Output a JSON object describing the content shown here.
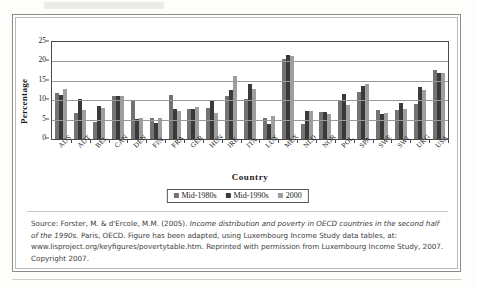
{
  "chart_data": {
    "type": "bar",
    "title": "",
    "xlabel": "Country",
    "ylabel": "Percentage",
    "ylim": [
      0,
      25
    ],
    "yticks": [
      0,
      5,
      10,
      15,
      20,
      25
    ],
    "grid": true,
    "legend_position": "bottom",
    "categories": [
      "AUS",
      "AUT",
      "BEL",
      "CAN",
      "DEN",
      "FIN",
      "FRA",
      "GER",
      "HUN",
      "IRE",
      "ITA",
      "LUX",
      "MEX",
      "NLD",
      "NOR",
      "POL",
      "SPA",
      "SWE",
      "SWI",
      "UKG",
      "USA"
    ],
    "series": [
      {
        "name": "Mid-1980s",
        "color": "#737373",
        "values": [
          11.8,
          6.6,
          4.4,
          11.2,
          9.9,
          5.3,
          11.4,
          7.8,
          8.1,
          11.0,
          10.3,
          5.3,
          20.7,
          3.9,
          6.9,
          9.8,
          12.2,
          7.4,
          7.6,
          9.1,
          17.8
        ]
      },
      {
        "name": "Mid-1990s",
        "color": "#3a3a3a",
        "values": [
          11.3,
          10.4,
          8.5,
          11.1,
          5.1,
          4.2,
          7.8,
          7.8,
          10.0,
          12.7,
          14.1,
          3.9,
          21.7,
          7.2,
          7.0,
          11.5,
          13.7,
          6.5,
          9.3,
          13.4,
          17.1
        ]
      },
      {
        "name": "2000",
        "color": "#9e9e9e",
        "values": [
          12.8,
          7.5,
          7.9,
          11.2,
          5.3,
          5.3,
          7.2,
          8.3,
          6.8,
          16.2,
          12.8,
          5.9,
          21.4,
          7.1,
          6.5,
          8.7,
          14.3,
          6.6,
          7.8,
          12.6,
          17.1
        ]
      }
    ]
  },
  "legend": {
    "items": [
      {
        "label": "Mid-1980s"
      },
      {
        "label": "Mid-1990s"
      },
      {
        "label": "2000"
      }
    ]
  },
  "caption": {
    "part1": "Source: Forster, M. & d'Ercole, M.M. (2005). ",
    "italic1": "Income distribution and poverty in OECD countries in the second half of the 1990s",
    "part2": ". Paris, OECD. Figure has been adapted, using Luxembourg Income Study data tables, at: www.lisproject.org/keyfigures/povertytable.htm. Reprinted with permission from Luxembourg Income Study, 2007. Copyright 2007."
  }
}
